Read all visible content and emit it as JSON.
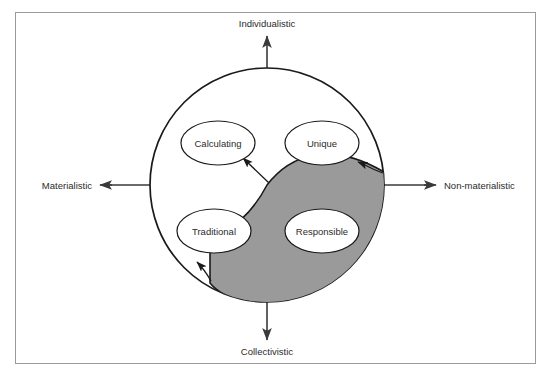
{
  "diagram": {
    "frame": {
      "border_color": "#9b9b9b"
    },
    "axes": {
      "vertical": {
        "top_label": "Individualistic",
        "bottom_label": "Collectivistic"
      },
      "horizontal": {
        "left_label": "Materialistic",
        "right_label": "Non-materialistic"
      },
      "line_color": "#3a3a3a"
    },
    "circle": {
      "center_x": 267,
      "center_y": 185,
      "radius": 117,
      "stroke_color": "#1a1a1a",
      "fill_color": "#ffffff"
    },
    "shaded_region": {
      "label": "shaded-leaf-region",
      "fill_color": "#9a9a9a",
      "stroke_color": "#1a1a1a",
      "quadrants": "lower-right extending into upper-right and lower-left"
    },
    "nodes": [
      {
        "id": "calculating",
        "label": "Calculating",
        "quadrant": "upper-left",
        "cx": 218,
        "cy": 143,
        "rx": 37,
        "ry": 22
      },
      {
        "id": "unique",
        "label": "Unique",
        "quadrant": "upper-right",
        "cx": 322,
        "cy": 143,
        "rx": 37,
        "ry": 22
      },
      {
        "id": "traditional",
        "label": "Traditional",
        "quadrant": "lower-left",
        "cx": 214,
        "cy": 231,
        "rx": 37,
        "ry": 22
      },
      {
        "id": "responsible",
        "label": "Responsible",
        "quadrant": "lower-right",
        "cx": 322,
        "cy": 231,
        "rx": 37,
        "ry": 22
      }
    ],
    "arrows": [
      {
        "id": "arrow-to-upper-left",
        "points_to": "upper-left quadrant",
        "color": "#1a1a1a"
      },
      {
        "id": "arrow-to-unique",
        "points_to": "Unique ellipse",
        "color": "#1a1a1a"
      },
      {
        "id": "arrow-to-traditional",
        "points_to": "Traditional ellipse",
        "color": "#1a1a1a"
      }
    ]
  }
}
